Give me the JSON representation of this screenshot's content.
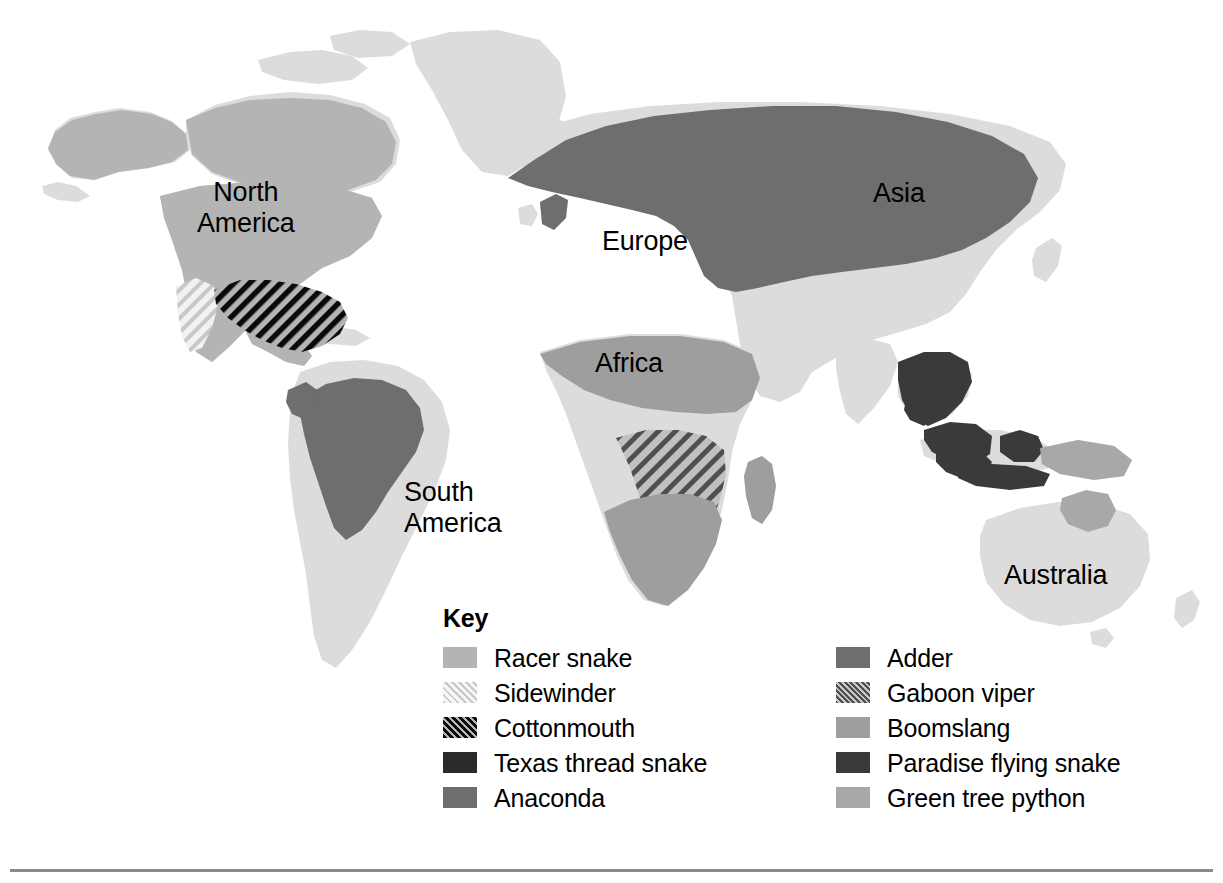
{
  "map": {
    "title": "World distribution of snake species",
    "continent_labels": [
      {
        "name": "north-america",
        "text": "North\nAmerica"
      },
      {
        "name": "south-america",
        "text": "South\nAmerica"
      },
      {
        "name": "europe",
        "text": "Europe"
      },
      {
        "name": "asia",
        "text": "Asia"
      },
      {
        "name": "africa",
        "text": "Africa"
      },
      {
        "name": "australia",
        "text": "Australia"
      }
    ],
    "base_land_color": "#dcdcdc",
    "ocean_color": "#ffffff"
  },
  "legend": {
    "title": "Key",
    "columns": [
      {
        "name": "legend-column-left",
        "items": [
          {
            "label": "Racer snake",
            "color": "#b4b4b4",
            "pattern": "solid",
            "region": "North America (USA, Mexico, Central America)"
          },
          {
            "label": "Sidewinder",
            "color": "#ececec",
            "pattern": "hatch-light",
            "region": "Southwestern United States"
          },
          {
            "label": "Cottonmouth",
            "color": "#0a0a0a",
            "pattern": "hatch-dark",
            "region": "Southeastern United States"
          },
          {
            "label": "Texas thread snake",
            "color": "#2a2a2a",
            "pattern": "solid",
            "region": "Texas / northern Mexico"
          },
          {
            "label": "Anaconda",
            "color": "#6e6e6e",
            "pattern": "solid",
            "region": "Amazon basin, South America"
          }
        ]
      },
      {
        "name": "legend-column-right",
        "items": [
          {
            "label": "Adder",
            "color": "#6e6e6e",
            "pattern": "solid",
            "region": "Europe and northern Asia"
          },
          {
            "label": "Gaboon viper",
            "color": "#5f5f5f",
            "pattern": "hatch-medium",
            "region": "Central Africa"
          },
          {
            "label": "Boomslang",
            "color": "#9e9e9e",
            "pattern": "solid",
            "region": "Sub-Saharan / southern Africa"
          },
          {
            "label": "Paradise flying snake",
            "color": "#3a3a3a",
            "pattern": "solid",
            "region": "Southeast Asia and Indonesia"
          },
          {
            "label": "Green tree python",
            "color": "#a8a8a8",
            "pattern": "solid",
            "region": "New Guinea and northern Australia"
          }
        ]
      }
    ]
  },
  "footer": {
    "rule_color": "#8a8a8a"
  }
}
